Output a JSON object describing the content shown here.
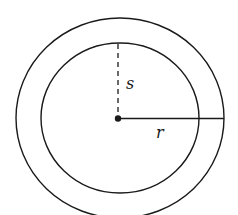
{
  "diagram": {
    "type": "concentric-circles",
    "labels": {
      "inner_label": "s",
      "outer_label": "r"
    },
    "colors": {
      "stroke": "#1a1a1a",
      "background": "#ffffff"
    },
    "shapes": {
      "center": {
        "x": 119,
        "y": 118
      },
      "outer_circle": {
        "rx": 104,
        "ry": 100
      },
      "inner_circle": {
        "rx": 79,
        "ry": 75
      }
    }
  }
}
